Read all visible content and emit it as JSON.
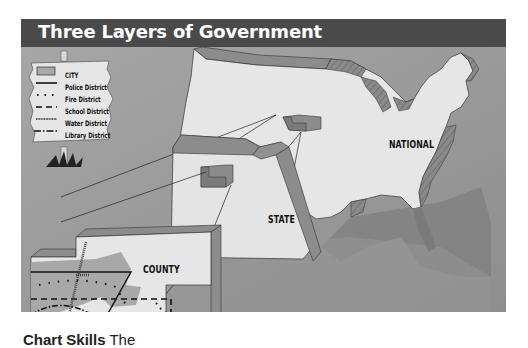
{
  "title": "Three Layers of Government",
  "legend": {
    "items": [
      {
        "symbol": "gray-box",
        "label": "CITY"
      },
      {
        "symbol": "solid-line",
        "label": "Police District"
      },
      {
        "symbol": "dotted-line",
        "label": "Fire District"
      },
      {
        "symbol": "dashed-line",
        "label": "School District"
      },
      {
        "symbol": "hatched-line",
        "label": "Water District"
      },
      {
        "symbol": "dash-dot-line",
        "label": "Library District"
      }
    ]
  },
  "layers": {
    "national": "NATIONAL",
    "state": "STATE",
    "county": "COUNTY"
  },
  "caption": {
    "bold": "Chart Skills",
    "text": "The"
  },
  "colors": {
    "title_bar": "#4a4a4a",
    "background": "#9a9a9a",
    "map_light": "#e6e6e6",
    "block_side": "#8c8c8c"
  }
}
